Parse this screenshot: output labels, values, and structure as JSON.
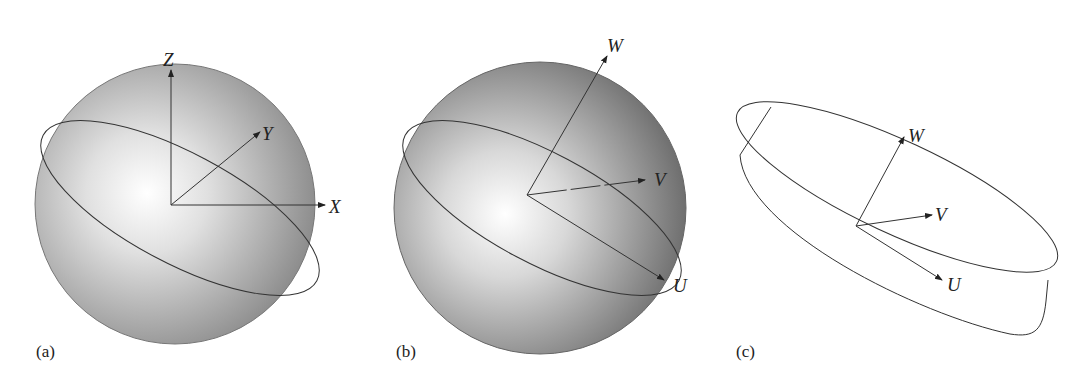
{
  "figure": {
    "panels": [
      {
        "id": "a",
        "label": "(a)",
        "shape": "sphere",
        "axes": [
          {
            "name": "Z",
            "label": "Z"
          },
          {
            "name": "Y",
            "label": "Y"
          },
          {
            "name": "X",
            "label": "X"
          }
        ]
      },
      {
        "id": "b",
        "label": "(b)",
        "shape": "sphere",
        "axes": [
          {
            "name": "W",
            "label": "W"
          },
          {
            "name": "V",
            "label": "V"
          },
          {
            "name": "U",
            "label": "U"
          }
        ]
      },
      {
        "id": "c",
        "label": "(c)",
        "shape": "disk",
        "axes": [
          {
            "name": "W",
            "label": "W"
          },
          {
            "name": "V",
            "label": "V"
          },
          {
            "name": "U",
            "label": "U"
          }
        ]
      }
    ],
    "colors": {
      "sphere_edge": "#7a7a7a",
      "sphere_center": "#ffffff",
      "line": "#333333"
    }
  }
}
